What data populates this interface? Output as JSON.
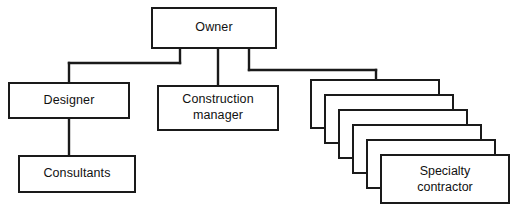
{
  "diagram": {
    "type": "organizational-chart",
    "background_color": "#ffffff",
    "line_color": "#1a1a1a",
    "text_color": "#111111",
    "nodes": [
      {
        "id": "owner",
        "label": "Owner",
        "x": 151,
        "y": 7,
        "width": 126,
        "height": 42,
        "level": 0
      },
      {
        "id": "designer",
        "label": "Designer",
        "x": 8,
        "y": 82,
        "width": 122,
        "height": 37,
        "level": 1
      },
      {
        "id": "construction-manager",
        "label": "Construction\nmanager",
        "x": 157,
        "y": 85,
        "width": 122,
        "height": 46,
        "level": 1
      },
      {
        "id": "consultants",
        "label": "Consultants",
        "x": 18,
        "y": 155,
        "width": 118,
        "height": 38,
        "level": 2
      }
    ],
    "stack": {
      "id": "specialty-contractor-stack",
      "label": "Specialty\ncontractor",
      "count": 6,
      "x": 310,
      "y": 79,
      "width": 130,
      "height": 50,
      "offset_x": 14,
      "offset_y": 15
    },
    "connectors": [
      {
        "from": "owner",
        "to": "designer"
      },
      {
        "from": "owner",
        "to": "construction-manager"
      },
      {
        "from": "owner",
        "to": "specialty-contractor-stack"
      },
      {
        "from": "designer",
        "to": "consultants"
      }
    ]
  }
}
